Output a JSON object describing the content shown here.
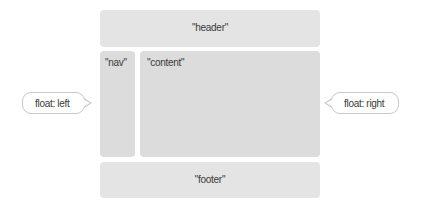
{
  "diagram": {
    "blocks": {
      "header": "\"header\"",
      "nav": "\"nav\"",
      "content": "\"content\"",
      "footer": "\"footer\""
    },
    "callouts": {
      "left": "float: left",
      "right": "float: right"
    },
    "colors": {
      "block_fill": "#e4e4e4",
      "column_fill": "#dcdcdc",
      "callout_border": "#c8c8c8"
    }
  }
}
